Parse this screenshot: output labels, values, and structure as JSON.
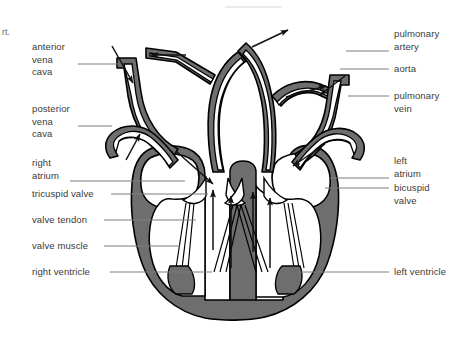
{
  "figure": {
    "corner_fragment": "rt.",
    "background_color": "#ffffff",
    "muscle_fill_color": "#6e6e6e",
    "outline_color": "#000000",
    "lumen_color": "#ffffff",
    "leader_line_color": "#7d7d7d",
    "label_text_color": "#3a3a3a"
  },
  "labels_left": [
    {
      "id": "anterior-vena-cava",
      "lines": [
        "anterior",
        "vena",
        "cava"
      ],
      "x": 32,
      "y": 41,
      "leader_y": 64,
      "leader_x1": 78,
      "leader_x2": 118
    },
    {
      "id": "posterior-vena-cava",
      "lines": [
        "posterior",
        "vena",
        "cava"
      ],
      "x": 32,
      "y": 103,
      "leader_y": 126,
      "leader_x1": 78,
      "leader_x2": 112
    },
    {
      "id": "right-atrium",
      "lines": [
        "right",
        "atrium"
      ],
      "x": 32,
      "y": 157,
      "leader_y": 181,
      "leader_x1": 70,
      "leader_x2": 185
    },
    {
      "id": "tricuspid-valve",
      "lines": [
        "tricuspid valve"
      ],
      "x": 32,
      "y": 188,
      "leader_y": 194,
      "leader_x1": 111,
      "leader_x2": 208
    },
    {
      "id": "valve-tendon",
      "lines": [
        "valve tendon"
      ],
      "x": 32,
      "y": 214,
      "leader_y": 220,
      "leader_x1": 104,
      "leader_x2": 196
    },
    {
      "id": "valve-muscle",
      "lines": [
        "valve muscle"
      ],
      "x": 32,
      "y": 240,
      "leader_y": 246,
      "leader_x1": 104,
      "leader_x2": 180
    },
    {
      "id": "right-ventricle",
      "lines": [
        "right ventricle"
      ],
      "x": 32,
      "y": 266,
      "leader_y": 272,
      "leader_x1": 110,
      "leader_x2": 212
    }
  ],
  "labels_right": [
    {
      "id": "pulmonary-artery",
      "lines": [
        "pulmonary",
        "artery"
      ],
      "x": 394,
      "y": 28,
      "leader_y": 51,
      "leader_x1": 346,
      "leader_x2": 389
    },
    {
      "id": "aorta",
      "lines": [
        "aorta"
      ],
      "x": 394,
      "y": 63,
      "leader_y": 69,
      "leader_x1": 340,
      "leader_x2": 389
    },
    {
      "id": "pulmonary-vein",
      "lines": [
        "pulmonary",
        "vein"
      ],
      "x": 394,
      "y": 90,
      "leader_y": 96,
      "leader_x1": 348,
      "leader_x2": 389
    },
    {
      "id": "left-atrium",
      "lines": [
        "left",
        "atrium"
      ],
      "x": 394,
      "y": 155,
      "leader_y": 178,
      "leader_x1": 330,
      "leader_x2": 389
    },
    {
      "id": "bicuspid-valve",
      "lines": [
        "bicuspid",
        "valve"
      ],
      "x": 394,
      "y": 182,
      "leader_y": 188,
      "leader_x1": 325,
      "leader_x2": 389
    },
    {
      "id": "left-ventricle",
      "lines": [
        "left ventricle"
      ],
      "x": 394,
      "y": 266,
      "leader_y": 272,
      "leader_x1": 300,
      "leader_x2": 389
    }
  ],
  "flow_arrows": [
    {
      "id": "arrow-anterior-vena-cava-in",
      "direction": "down-right"
    },
    {
      "id": "arrow-posterior-vena-cava-in",
      "direction": "up-right"
    },
    {
      "id": "arrow-right-atrium-in",
      "direction": "down-right"
    },
    {
      "id": "arrow-tricuspid-through",
      "direction": "up"
    },
    {
      "id": "arrow-right-ventricle-out",
      "direction": "up"
    },
    {
      "id": "arrow-pulmonary-artery-left",
      "direction": "left"
    },
    {
      "id": "arrow-pulmonary-artery-right",
      "direction": "up-right"
    },
    {
      "id": "arrow-aorta-out",
      "direction": "up-right"
    },
    {
      "id": "arrow-pulmonary-vein-in",
      "direction": "down-left"
    },
    {
      "id": "arrow-left-atrium-in",
      "direction": "down-left"
    },
    {
      "id": "arrow-bicuspid-through",
      "direction": "up"
    },
    {
      "id": "arrow-left-ventricle-out",
      "direction": "up"
    }
  ]
}
